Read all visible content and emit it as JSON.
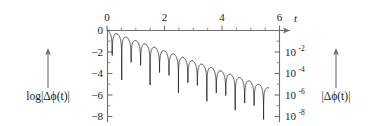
{
  "figure": {
    "background_color": "#ffffff",
    "curve_color": "#2b2b2b",
    "axis_color": "#6e6e6e",
    "text_color": "#1a1a1a",
    "left_axis_label": "log|Δϕ(t)|",
    "right_axis_label": "|Δϕ(t)|",
    "top_axis_label": "t",
    "left_arrow_icon": "up-arrow-icon",
    "right_arrow_icon": "up-arrow-icon",
    "t_arrow_icon": "right-arrow-icon"
  },
  "chart_data": {
    "type": "line",
    "title": "",
    "subtitle": "",
    "xlabel": "t",
    "ylabel": "log|Δϕ(t)|",
    "y2label": "|Δϕ(t)|",
    "xlim": [
      0,
      6.2
    ],
    "ylim": [
      -8.9,
      0.4
    ],
    "grid": false,
    "legend": null,
    "x_axis_position": "top",
    "y_axis_position": "left",
    "y2_axis_position": "right",
    "xticks": [
      0,
      2,
      4,
      6
    ],
    "xticklabels": [
      "0",
      "2",
      "4",
      "6"
    ],
    "xminorticks": [
      0.5,
      1,
      1.5,
      2.5,
      3,
      3.5,
      4.5,
      5,
      5.5
    ],
    "yticks": [
      0,
      -2,
      -4,
      -6,
      -8
    ],
    "yticklabels": [
      "0",
      "−2",
      "−4",
      "−6",
      "−8"
    ],
    "yminorticks": [
      -1,
      -3,
      -5,
      -7
    ],
    "y2ticks": [
      -2,
      -4,
      -6,
      -8
    ],
    "y2ticklabels": [
      "10⁻²",
      "10⁻⁴",
      "10⁻⁶",
      "10⁻⁸"
    ],
    "y2_mantissa": [
      "10",
      "10",
      "10",
      "10"
    ],
    "y2_exponents": [
      "-2",
      "-4",
      "-6",
      "-8"
    ],
    "series": [
      {
        "name": "log|Δϕ(t)|",
        "description": "Linearly decaying envelope with oscillatory zeros producing downward spikes",
        "envelope_slope": -0.95,
        "envelope_intercept": 0.0,
        "oscillation_period": 0.33,
        "t_start": 0.0,
        "t_end": 5.62,
        "spike_floor": -8.7,
        "n_oscillations": 17,
        "x": [
          0.0,
          0.17,
          0.33,
          0.5,
          0.66,
          0.83,
          0.99,
          1.16,
          1.32,
          1.49,
          1.65,
          1.82,
          1.98,
          2.15,
          2.31,
          2.48,
          2.64,
          2.81,
          2.97,
          3.14,
          3.3,
          3.47,
          3.63,
          3.8,
          3.96,
          4.13,
          4.29,
          4.46,
          4.62,
          4.79,
          4.95,
          5.12,
          5.28,
          5.45,
          5.62
        ],
        "y": [
          0.0,
          -0.16,
          -3.6,
          -0.47,
          -0.63,
          -3.9,
          -0.94,
          -1.1,
          -4.25,
          -1.42,
          -1.57,
          -4.6,
          -1.88,
          -2.04,
          -4.95,
          -2.36,
          -2.51,
          -5.35,
          -2.82,
          -2.98,
          -5.8,
          -3.3,
          -3.45,
          -6.25,
          -3.76,
          -3.92,
          -6.75,
          -4.24,
          -4.39,
          -7.3,
          -4.71,
          -4.86,
          -7.95,
          -5.18,
          -5.33
        ]
      }
    ]
  }
}
